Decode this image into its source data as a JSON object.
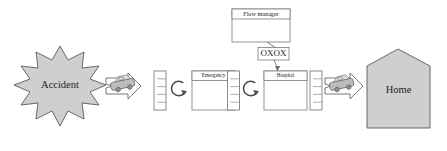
{
  "diagram": {
    "type": "process-flow",
    "colors": {
      "shape_fill": "#cfcfcf",
      "shape_stroke": "#5a5a5a",
      "box_fill": "#ffffff",
      "box_stroke": "#7a7a7a",
      "connector": "#666666",
      "text": "#231f20",
      "background": "#ffffff"
    },
    "nodes": {
      "accident": {
        "label": "Accident",
        "shape": "starburst",
        "points": 12,
        "fill": "#cfcfcf"
      },
      "emergency": {
        "label": "Emergency",
        "shape": "titled-box"
      },
      "hospital": {
        "label": "Hospital",
        "shape": "titled-box"
      },
      "flow_manager": {
        "label": "Flow manager",
        "shape": "titled-box"
      },
      "oxox": {
        "label": "OXOX",
        "shape": "label-box"
      },
      "home": {
        "label": "Home",
        "shape": "house",
        "fill": "#cfcfcf"
      }
    },
    "queues": [
      {
        "name": "queue-1",
        "slots": 5
      },
      {
        "name": "queue-2",
        "slots": 5
      },
      {
        "name": "queue-3",
        "slots": 5
      },
      {
        "name": "queue-4",
        "slots": 5
      }
    ],
    "servers": [
      {
        "name": "server-1",
        "icon": "circular-arrow"
      },
      {
        "name": "server-2",
        "icon": "circular-arrow"
      }
    ],
    "vehicles": [
      {
        "name": "ambulance-1",
        "icon": "ambulance"
      },
      {
        "name": "ambulance-2",
        "icon": "ambulance"
      }
    ],
    "flow_order": [
      "Accident",
      "Queue",
      "Emergency",
      "Queue",
      "Hospital",
      "Queue",
      "Home"
    ],
    "connections": [
      {
        "from": "Flow manager",
        "to": "OXOX",
        "style": "line"
      },
      {
        "from": "OXOX",
        "to": "Hospital",
        "style": "arrow"
      }
    ]
  }
}
